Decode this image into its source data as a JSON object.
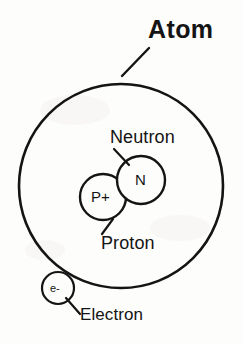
{
  "diagram": {
    "title": "Atom",
    "background_color": "#fdfdfc",
    "ink_color": "#141414",
    "labels": {
      "neutron": "Neutron",
      "proton": "Proton",
      "electron": "Electron"
    },
    "particles": {
      "proton_symbol": "P+",
      "neutron_symbol": "N",
      "electron_symbol": "e-"
    },
    "geometry": {
      "atom_shell": {
        "cx": 121,
        "cy": 186,
        "r": 102
      },
      "proton_circle": {
        "cx": 103,
        "cy": 197,
        "r": 23
      },
      "neutron_circle": {
        "cx": 141,
        "cy": 180,
        "r": 24
      },
      "electron_circle": {
        "cx": 58,
        "cy": 288,
        "r": 16
      }
    },
    "leaders": {
      "atom": {
        "x1": 122,
        "y1": 76,
        "x2": 149,
        "y2": 48
      },
      "neutron": {
        "x1": 114,
        "y1": 149,
        "x2": 129,
        "y2": 165
      },
      "proton": {
        "x1": 113,
        "y1": 219,
        "x2": 102,
        "y2": 234
      },
      "electron": {
        "x1": 66,
        "y1": 298,
        "x2": 80,
        "y2": 314
      }
    }
  }
}
